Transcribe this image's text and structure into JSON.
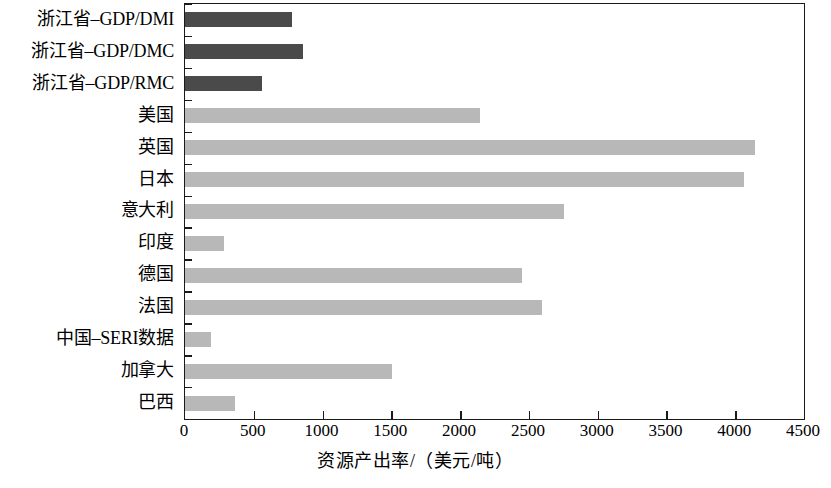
{
  "chart_data": {
    "type": "bar",
    "orientation": "horizontal",
    "title": "",
    "xlabel": "资源产出率/（美元/吨）",
    "ylabel": "",
    "xlim": [
      0,
      4500
    ],
    "ylim": null,
    "grid": false,
    "legend": null,
    "xticks": [
      0,
      500,
      1000,
      1500,
      2000,
      2500,
      3000,
      3500,
      4000,
      4500
    ],
    "xtick_labels": [
      "0",
      "500",
      "1000",
      "1500",
      "2000",
      "2500",
      "3000",
      "3500",
      "4000",
      "4500"
    ],
    "categories": [
      "浙江省–GDP/DMI",
      "浙江省–GDP/DMC",
      "浙江省–GDP/RMC",
      "美国",
      "英国",
      "日本",
      "意大利",
      "印度",
      "德国",
      "法国",
      "中国–SERI数据",
      "加拿大",
      "巴西"
    ],
    "values": [
      778,
      858,
      560,
      2144,
      4142,
      4062,
      2754,
      283,
      2449,
      2594,
      189,
      1505,
      363
    ],
    "bar_colors": [
      "#4a4a4a",
      "#4a4a4a",
      "#4a4a4a",
      "#b8b8b8",
      "#b8b8b8",
      "#b8b8b8",
      "#b8b8b8",
      "#b8b8b8",
      "#b8b8b8",
      "#b8b8b8",
      "#b8b8b8",
      "#b8b8b8",
      "#b8b8b8"
    ],
    "colors": {
      "dark_bar": "#4a4a4a",
      "light_bar": "#b8b8b8",
      "axis": "#1a1a1a",
      "background": "#ffffff",
      "text": "#000000"
    }
  }
}
